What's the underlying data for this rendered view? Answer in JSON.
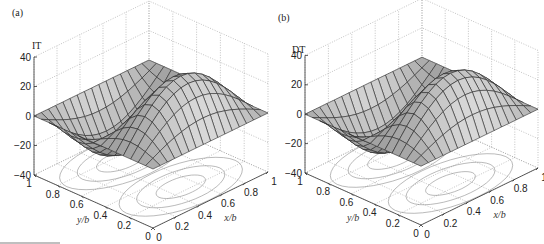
{
  "chart_data": [
    {
      "type": "surface3d",
      "panel_label": "(a)",
      "title": "",
      "zlabel": "IT",
      "xlabel": "x/b",
      "ylabel": "y/b",
      "xlim": [
        0,
        1
      ],
      "ylim": [
        0,
        1
      ],
      "zlim": [
        -40,
        40
      ],
      "xticks": [
        "0",
        "0.2",
        "0.4",
        "0.6",
        "0.8",
        "1"
      ],
      "yticks": [
        "0",
        "0.2",
        "0.4",
        "0.6",
        "0.8",
        "1"
      ],
      "zticks": [
        "-40",
        "-20",
        "0",
        "20",
        "40"
      ],
      "grid": true,
      "surface": {
        "function": "35*sin(pi*x)*sin(2*pi*y)",
        "amplitude": 35,
        "mesh_resolution": 16,
        "peak": {
          "x": 0.5,
          "y": 0.25,
          "z": 35
        },
        "trough": {
          "x": 0.5,
          "y": 0.75,
          "z": -35
        }
      },
      "contour_projection": {
        "plane_z": -40,
        "levels": 3
      }
    },
    {
      "type": "surface3d",
      "panel_label": "(b)",
      "title": "",
      "zlabel": "DT",
      "xlabel": "x/b",
      "ylabel": "y/b",
      "xlim": [
        0,
        1
      ],
      "ylim": [
        0,
        1
      ],
      "zlim": [
        -40,
        40
      ],
      "xticks": [
        "0",
        "0.2",
        "0.4",
        "0.6",
        "0.8",
        "1"
      ],
      "yticks": [
        "0",
        "0.2",
        "0.4",
        "0.6",
        "0.8",
        "1"
      ],
      "zticks": [
        "-40",
        "-20",
        "0",
        "20",
        "40"
      ],
      "grid": true,
      "surface": {
        "function": "35*sin(pi*x)*sin(2*pi*y)",
        "amplitude": 35,
        "mesh_resolution": 16,
        "peak": {
          "x": 0.5,
          "y": 0.25,
          "z": 35
        },
        "trough": {
          "x": 0.5,
          "y": 0.75,
          "z": -35
        }
      },
      "contour_projection": {
        "plane_z": -40,
        "levels": 3
      }
    }
  ],
  "panels": [
    {
      "label": "(a)",
      "zlabel": "IT"
    },
    {
      "label": "(b)",
      "zlabel": "DT"
    }
  ]
}
